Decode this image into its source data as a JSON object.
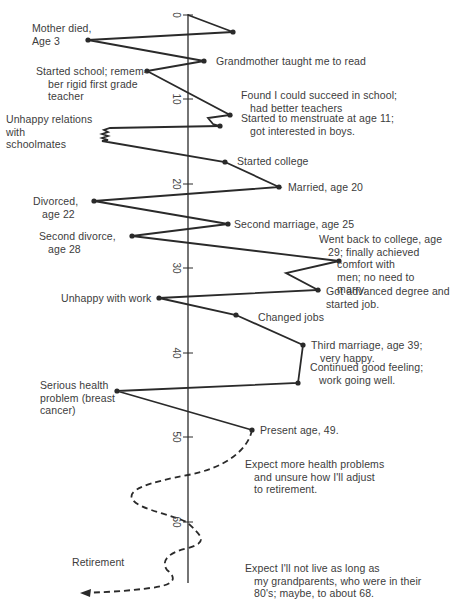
{
  "diagram": {
    "type": "lifeline",
    "axis": {
      "label": "Age",
      "ticks": [
        "0",
        "10",
        "20",
        "30",
        "40",
        "50",
        "60"
      ]
    },
    "events": [
      {
        "id": "mother",
        "text": "Mother died,\nAge 3",
        "side": "left"
      },
      {
        "id": "grandmother",
        "text": "Grandmother taught me to read",
        "side": "right"
      },
      {
        "id": "school",
        "text": "Started school; remem-\n    ber rigid first grade\n    teacher",
        "side": "left"
      },
      {
        "id": "found",
        "text": "Found I could succeed in school;\n   had better teachers",
        "side": "right"
      },
      {
        "id": "menstruate",
        "text": "Started to menstruate at age 11;\n   got interested in boys.",
        "side": "right"
      },
      {
        "id": "schoolmates",
        "text": "Unhappy relations\nwith\nschoolmates",
        "side": "left"
      },
      {
        "id": "college",
        "text": "Started college",
        "side": "right"
      },
      {
        "id": "married",
        "text": "Married, age 20",
        "side": "right"
      },
      {
        "id": "divorced",
        "text": "Divorced,\n   age 22",
        "side": "left"
      },
      {
        "id": "second_marriage",
        "text": "Second marriage, age 25",
        "side": "right"
      },
      {
        "id": "second_divorce",
        "text": "Second divorce,\n   age 28",
        "side": "left"
      },
      {
        "id": "back_college",
        "text": "Went back to college, age\n   29; finally achieved\n      comfort with\n      men; no need to\n      marry.",
        "side": "right"
      },
      {
        "id": "advanced_degree",
        "text": "Got advanced degree and\nstarted job.",
        "side": "right"
      },
      {
        "id": "unhappy_work",
        "text": "Unhappy with work",
        "side": "left"
      },
      {
        "id": "changed_jobs",
        "text": "Changed jobs",
        "side": "right"
      },
      {
        "id": "third_marriage",
        "text": "Third marriage, age 39;\n   very happy.",
        "side": "right"
      },
      {
        "id": "good_feeling",
        "text": "Continued good feeling;\n   work going well.",
        "side": "right"
      },
      {
        "id": "health",
        "text": "Serious health\nproblem (breast\ncancer)",
        "side": "left"
      },
      {
        "id": "present",
        "text": "Present age, 49.",
        "side": "right"
      },
      {
        "id": "expect_health",
        "text": "Expect more health problems\n   and unsure how I'll adjust\n   to retirement.",
        "side": "right"
      },
      {
        "id": "retirement",
        "text": "Retirement",
        "side": "left"
      },
      {
        "id": "expect_live",
        "text": "Expect I'll not live as long as\n   my grandparents, who were in their\n   80's; maybe, to about 68.",
        "side": "right"
      }
    ],
    "colors": {
      "line": "#2a2a2a",
      "text": "#3c3c3c",
      "background": "#ffffff"
    }
  }
}
